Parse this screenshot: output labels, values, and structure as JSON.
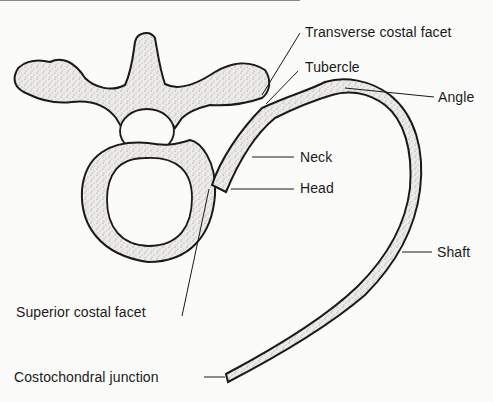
{
  "diagram": {
    "labels": {
      "transverse_costal_facet": "Transverse costal facet",
      "tubercle": "Tubercle",
      "angle": "Angle",
      "neck": "Neck",
      "head": "Head",
      "shaft": "Shaft",
      "superior_costal_facet": "Superior costal facet",
      "costochondral_junction": "Costochondral junction"
    },
    "colors": {
      "background": "#fbfbf9",
      "ink": "#1a1a1a",
      "bone_fill": "#e6e4df",
      "stipple": "#8a8883"
    }
  }
}
